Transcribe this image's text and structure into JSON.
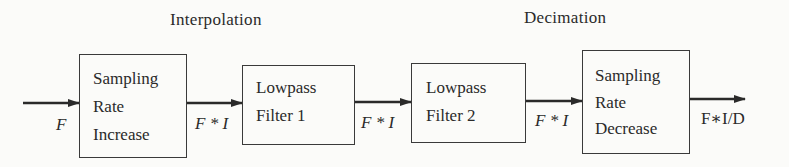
{
  "titles": {
    "interpolation": "Interpolation",
    "decimation": "Decimation"
  },
  "blocks": [
    {
      "id": "sampling-rate-increase",
      "lines": [
        "Sampling",
        "Rate",
        "Increase"
      ]
    },
    {
      "id": "lowpass-filter-1",
      "lines": [
        "Lowpass",
        "Filter 1"
      ]
    },
    {
      "id": "lowpass-filter-2",
      "lines": [
        "Lowpass",
        "Filter 2"
      ]
    },
    {
      "id": "sampling-rate-decrease",
      "lines": [
        "Sampling",
        "Rate",
        "Decrease"
      ]
    }
  ],
  "signals": {
    "input": "F",
    "after_increase": "F * I",
    "after_filter1": "F * I",
    "after_filter2": "F * I",
    "output": "F∗I/D"
  },
  "colors": {
    "line": "#2a2a2a",
    "background": "#fbfbf9"
  }
}
